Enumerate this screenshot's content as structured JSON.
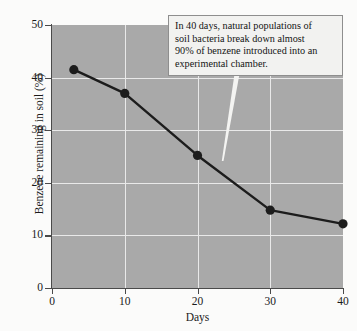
{
  "chart_data": {
    "type": "line",
    "title": "",
    "xlabel": "Days",
    "ylabel": "Benzene remaining in soil (%)",
    "xlim": [
      0,
      40
    ],
    "ylim": [
      0,
      50
    ],
    "xticks": [
      0,
      10,
      20,
      30,
      40
    ],
    "yticks": [
      0,
      10,
      20,
      30,
      40,
      50
    ],
    "grid": true,
    "legend": "none",
    "x": [
      3,
      10,
      20,
      30,
      40
    ],
    "values": [
      41.5,
      37.0,
      25.2,
      14.8,
      12.2
    ],
    "series": [
      {
        "name": "Benzene remaining in soil",
        "x": [
          3,
          10,
          20,
          30,
          40
        ],
        "values": [
          41.5,
          37.0,
          25.2,
          14.8,
          12.2
        ]
      }
    ],
    "annotations": [
      {
        "text": "In 40 days, natural populations of soil bacteria break down almost 90% of benzene introduced into an experimental chamber.",
        "points_to_x": 23,
        "points_to_y": 24
      }
    ],
    "colors": {
      "plot_background": "#a9a9a9",
      "gridline": "#e9e9e9",
      "line": "#1c1c1c",
      "marker": "#1c1c1c",
      "axis": "#4a4a4a",
      "callout_background": "#f2f2f0",
      "callout_border": "#8e8e8e",
      "leader_line": "#f4f4f2"
    }
  },
  "axes": {
    "y_title": "Benzene remaining in soil (%)",
    "x_title": "Days",
    "y_ticks": [
      "50",
      "40",
      "30",
      "20",
      "10",
      "0"
    ],
    "x_ticks": [
      "0",
      "10",
      "20",
      "30",
      "40"
    ]
  },
  "annotation": {
    "line1": "In 40 days, natural populations of",
    "line2": "soil bacteria break down almost",
    "line3": "90% of benzene introduced into an",
    "line4": "experimental chamber."
  }
}
